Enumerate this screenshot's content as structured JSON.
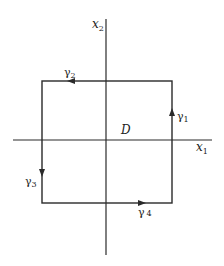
{
  "diagram": {
    "axes": {
      "x_label": "x",
      "x_sub": "1",
      "y_label": "x",
      "y_sub": "2"
    },
    "region_label": "D",
    "curves": [
      {
        "name": "γ",
        "sub": "1",
        "side": "right",
        "direction": "up"
      },
      {
        "name": "γ",
        "sub": "2",
        "side": "top",
        "direction": "left"
      },
      {
        "name": "γ",
        "sub": "3",
        "side": "left",
        "direction": "down"
      },
      {
        "name": "γ",
        "sub": "4",
        "side": "bottom",
        "direction": "right"
      }
    ],
    "colors": {
      "stroke": "#2a2a2a",
      "background": "#ffffff"
    }
  }
}
